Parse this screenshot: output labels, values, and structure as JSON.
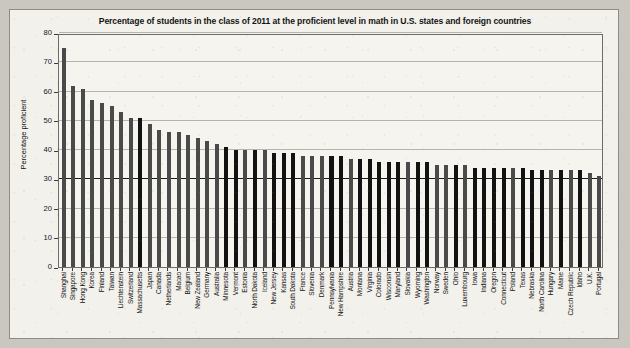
{
  "chart_data": {
    "type": "bar",
    "title": "Percentage of students in the class of 2011 at the proficient level in math in U.S. states and foreign countries",
    "xlabel": "",
    "ylabel": "Percentage proficient",
    "ylim": [
      0,
      80
    ],
    "yticks": [
      0,
      10,
      20,
      30,
      40,
      50,
      60,
      70,
      80
    ],
    "grid": true,
    "reference_line": 30,
    "legend": null,
    "categories": [
      "Shanghai",
      "Singapore",
      "Hong Kong",
      "Korea",
      "Finland",
      "Taiwan",
      "Liechtenstein",
      "Switzerland",
      "Massachusetts",
      "Japan",
      "Canada",
      "Netherlands",
      "Macao",
      "Belgium",
      "New Zealand",
      "Germany",
      "Australia",
      "Minnesota",
      "Vermont",
      "Estonia",
      "North Dakota",
      "Iceland",
      "New Jersey",
      "Kansas",
      "South Dakota",
      "France",
      "Slovenia",
      "Denmark",
      "Pennsylvania",
      "New Hampshire",
      "Austria",
      "Montana",
      "Virginia",
      "Colorado",
      "Wisconsin",
      "Maryland",
      "Slovakia",
      "Wyoming",
      "Washington",
      "Norway",
      "Sweden",
      "Ohio",
      "Luxembourg",
      "Iowa",
      "Indiana",
      "Oregon",
      "Connecticut",
      "Poland",
      "Texas",
      "Nebraska",
      "North Carolina",
      "Hungary",
      "Maine",
      "Czech Republic",
      "Idaho",
      "U.K.",
      "Portugal"
    ],
    "values": [
      75,
      62,
      61,
      57,
      56,
      55,
      53,
      51,
      51,
      49,
      47,
      46,
      46,
      45,
      44,
      43,
      42,
      41,
      40,
      40,
      40,
      40,
      39,
      39,
      39,
      38,
      38,
      38,
      38,
      38,
      37,
      37,
      37,
      36,
      36,
      36,
      36,
      36,
      36,
      35,
      35,
      35,
      35,
      34,
      34,
      34,
      34,
      34,
      34,
      33,
      33,
      33,
      33,
      33,
      33,
      32,
      31
    ],
    "series_groups": {
      "state": [
        "Massachusetts",
        "Minnesota",
        "Vermont",
        "North Dakota",
        "New Jersey",
        "Kansas",
        "South Dakota",
        "Pennsylvania",
        "New Hampshire",
        "Montana",
        "Virginia",
        "Colorado",
        "Wisconsin",
        "Maryland",
        "Wyoming",
        "Washington",
        "Ohio",
        "Iowa",
        "Indiana",
        "Oregon",
        "Connecticut",
        "Texas",
        "Nebraska",
        "North Carolina",
        "Maine",
        "Idaho"
      ],
      "state_color": "#121212",
      "country_color": "#4a4a4a"
    }
  }
}
